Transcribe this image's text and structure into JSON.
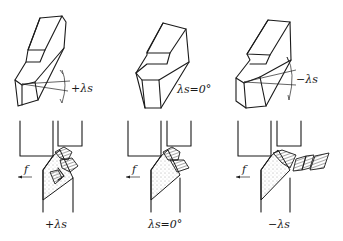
{
  "diagram": {
    "panels": [
      {
        "id": "positive",
        "top_label": "+λs",
        "bottom_label": "+λs",
        "feed_label": "f",
        "chip_flow": "toward machined surface"
      },
      {
        "id": "zero",
        "top_label": "λs=0°",
        "bottom_label": "λs=0°",
        "feed_label": "f",
        "chip_flow": "perpendicular to cutting edge"
      },
      {
        "id": "negative",
        "top_label": "−λs",
        "bottom_label": "−λs",
        "feed_label": "f",
        "chip_flow": "toward unmachined surface"
      }
    ],
    "colors": {
      "line": "#1a1a1a",
      "background": "#ffffff"
    }
  }
}
